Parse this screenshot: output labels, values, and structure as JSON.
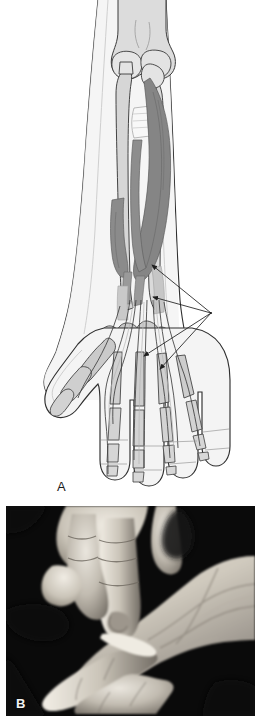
{
  "figure": {
    "type": "two-panel anatomical figure",
    "background_color": "#ffffff",
    "width": 261,
    "height": 726,
    "caption_partial": ""
  },
  "panel_a": {
    "label": "A",
    "kind": "line-art anatomical illustration",
    "subject": "right forearm and hand, palmar view",
    "description": "Grayscale diagram of the distal humerus, radius and ulna, carpal bones, metacarpals and phalanges with the flexor muscle bellies and long flexor tendons running into the digits. Four leader lines converge on a single point at the right.",
    "colors": {
      "skin_outline": "#2b2b2b",
      "skin_fill": "#f2f2f2",
      "bone_fill": "#d8d8d8",
      "bone_outline": "#3a3a3a",
      "muscle_dark": "#808080",
      "muscle_mid": "#a6a6a6",
      "tendon_fill": "#efefef",
      "leader_line": "#1f1f1f"
    },
    "structures": [
      "distal humerus",
      "olecranon / elbow joint",
      "radius",
      "ulna",
      "interosseous membrane",
      "flexor digitorum superficialis",
      "flexor digitorum profundus",
      "flexor pollicis longus",
      "carpal bones",
      "metacarpals",
      "proximal phalanges",
      "middle phalanges",
      "distal phalanges",
      "long flexor tendons"
    ],
    "leader_lines": {
      "count": 4,
      "convergence_point": {
        "x": 211,
        "y": 313
      },
      "arrow_targets": [
        {
          "x": 152,
          "y": 265
        },
        {
          "x": 153,
          "y": 297
        },
        {
          "x": 144,
          "y": 356
        },
        {
          "x": 160,
          "y": 369
        }
      ]
    }
  },
  "panel_b": {
    "label": "B",
    "kind": "black-and-white clinical photograph",
    "subject": "clinical hand examination",
    "description": "Examiner's hand holding and flexing a patient's finger against the open palm of the patient's hand; dark background.",
    "colors": {
      "background": "#0a0a0a",
      "skin_light": "#e8e4dc",
      "skin_mid": "#b9b3a8",
      "skin_shadow": "#6d6760",
      "deep_shadow": "#181818"
    },
    "frame": {
      "x": 6,
      "y": 506,
      "width": 249,
      "height": 210
    }
  }
}
